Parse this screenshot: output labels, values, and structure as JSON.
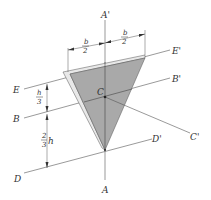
{
  "diagram": {
    "type": "geometry",
    "colors": {
      "plate_fill": "#a9a9a9",
      "plate_edge": "#e6e6e6",
      "line": "#555555",
      "text": "#333333"
    },
    "axes": [
      {
        "id": "AA",
        "start_label": "A",
        "end_label": "A'"
      },
      {
        "id": "BB",
        "start_label": "B",
        "end_label": "B'"
      },
      {
        "id": "CC",
        "start_label": "C",
        "end_label": "C'"
      },
      {
        "id": "DD",
        "start_label": "D",
        "end_label": "D'"
      },
      {
        "id": "EE",
        "start_label": "E",
        "end_label": "E'"
      }
    ],
    "dimensions": {
      "top_left": {
        "num": "b",
        "den": "2"
      },
      "top_right": {
        "num": "b",
        "den": "2"
      },
      "upper_height": {
        "num": "h",
        "den": "3",
        "suffix": ""
      },
      "lower_height": {
        "num": "2",
        "den": "3",
        "suffix": "h"
      }
    },
    "centroid_label": "C"
  }
}
